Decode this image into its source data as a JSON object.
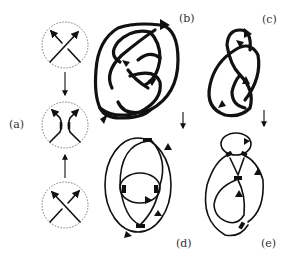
{
  "figure": {
    "panels": [
      {
        "id": "a",
        "label": "(a)",
        "description": "Crossing smoothing: positive and negative crossings resolve to oriented smoothing"
      },
      {
        "id": "b",
        "label": "(b)",
        "description": "Oriented knot diagram (figure-eight-like)"
      },
      {
        "id": "c",
        "label": "(c)",
        "description": "Oriented knot diagram"
      },
      {
        "id": "d",
        "label": "(d)",
        "description": "Seifert circles of diagram (b)"
      },
      {
        "id": "e",
        "label": "(e)",
        "description": "Seifert circles of diagram (c)"
      }
    ],
    "arrows": [
      {
        "from": "top-crossing",
        "to": "smoothing",
        "direction": "down"
      },
      {
        "from": "bottom-crossing",
        "to": "smoothing",
        "direction": "up"
      },
      {
        "from": "b",
        "to": "d",
        "direction": "down"
      },
      {
        "from": "c",
        "to": "e",
        "direction": "down"
      }
    ]
  }
}
